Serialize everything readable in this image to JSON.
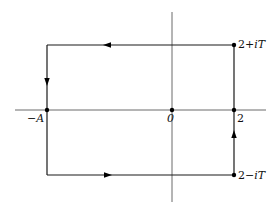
{
  "diagram": {
    "type": "complex-plane-contour",
    "axes": {
      "real_axis": {
        "x1": 15,
        "x2": 266,
        "y": 110
      },
      "imag_axis": {
        "x": 172,
        "y1": 12,
        "y2": 202
      },
      "color": "#6a6a6a"
    },
    "contour": {
      "left_x": 47,
      "right_x": 234,
      "top_y": 45,
      "bottom_y": 175,
      "color": "#1a1a1a",
      "direction": "counterclockwise"
    },
    "points": [
      {
        "id": "neg-A",
        "x": 47,
        "y": 110,
        "label": "−A"
      },
      {
        "id": "origin",
        "x": 172,
        "y": 110,
        "label": "0"
      },
      {
        "id": "two",
        "x": 234,
        "y": 110,
        "label": "2"
      },
      {
        "id": "two-plus-iT",
        "x": 234,
        "y": 45,
        "label": "2+iT"
      },
      {
        "id": "two-minus-iT",
        "x": 234,
        "y": 175,
        "label": "2−iT"
      }
    ],
    "labels": {
      "neg_A": "−A",
      "origin": "0",
      "two": "2",
      "two_plus_iT_num": "2+",
      "two_plus_iT_var": "iT",
      "two_minus_iT_num": "2−",
      "two_minus_iT_var": "iT"
    },
    "arrows": [
      {
        "id": "top",
        "x": 107,
        "y": 45,
        "direction": "left"
      },
      {
        "id": "left",
        "x": 47,
        "y": 82,
        "direction": "down"
      },
      {
        "id": "bottom",
        "x": 108,
        "y": 175,
        "direction": "right"
      },
      {
        "id": "right",
        "x": 234,
        "y": 134,
        "direction": "up"
      }
    ]
  }
}
